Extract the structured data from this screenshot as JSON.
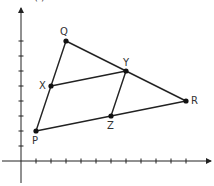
{
  "diagram": {
    "title_partial": "(   )",
    "origin_px": [
      21,
      161
    ],
    "unit_px": 15,
    "x_ticks": 11,
    "y_ticks": 8,
    "points": [
      {
        "label": "P",
        "x": 1,
        "y": 2
      },
      {
        "label": "Q",
        "x": 3,
        "y": 8
      },
      {
        "label": "R",
        "x": 11,
        "y": 4
      },
      {
        "label": "X",
        "x": 2,
        "y": 5
      },
      {
        "label": "Y",
        "x": 7,
        "y": 6
      },
      {
        "label": "Z",
        "x": 6,
        "y": 3
      }
    ],
    "segments": [
      [
        "P",
        "Q"
      ],
      [
        "Q",
        "R"
      ],
      [
        "R",
        "P"
      ],
      [
        "X",
        "Y"
      ],
      [
        "Y",
        "Z"
      ]
    ],
    "labels": {
      "P": "P",
      "Q": "Q",
      "R": "R",
      "X": "X",
      "Y": "Y",
      "Z": "Z"
    }
  }
}
